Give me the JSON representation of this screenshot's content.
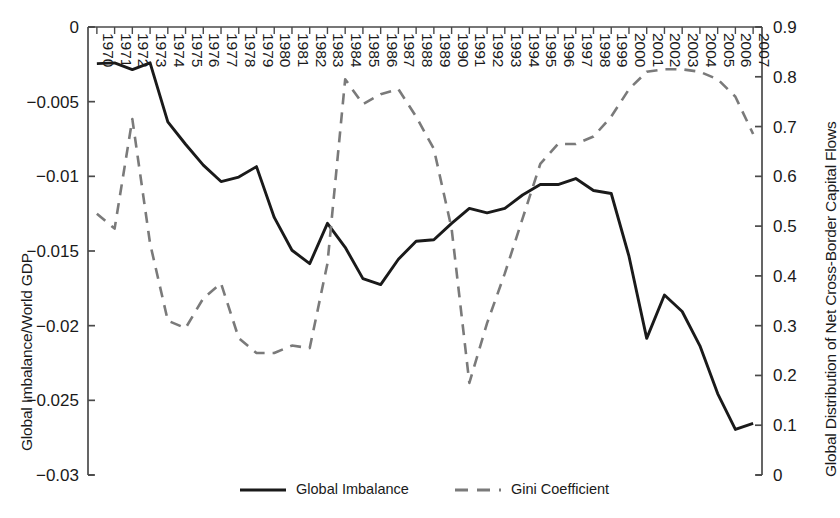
{
  "chart_data": {
    "type": "line",
    "title": "",
    "xlabel": "",
    "ylabel": "Global Imbalance/World GDP",
    "y2label": "Global Distribution of Net Cross-Border Capital Flows",
    "grid": false,
    "legend_position": "bottom-center",
    "x": [
      1970,
      1971,
      1972,
      1973,
      1974,
      1975,
      1976,
      1977,
      1978,
      1979,
      1980,
      1981,
      1982,
      1983,
      1984,
      1985,
      1986,
      1987,
      1988,
      1989,
      1990,
      1991,
      1992,
      1993,
      1994,
      1995,
      1996,
      1997,
      1998,
      1999,
      2000,
      2001,
      2002,
      2003,
      2004,
      2005,
      2006,
      2007
    ],
    "xtick_labels": [
      "1970",
      "1971",
      "1972",
      "1973",
      "1974",
      "1975",
      "1976",
      "1977",
      "1978",
      "1979",
      "1980",
      "1981",
      "1982",
      "1983",
      "1984",
      "1985",
      "1986",
      "1987",
      "1988",
      "1989",
      "1990",
      "1991",
      "1992",
      "1993",
      "1994",
      "1995",
      "1996",
      "1997",
      "1998",
      "1999",
      "2000",
      "2001",
      "2002",
      "2003",
      "2004",
      "2005",
      "2006",
      "2007"
    ],
    "ylim": [
      -0.03,
      0
    ],
    "ytick_labels": [
      "0",
      "−0.005",
      "−0.01",
      "−0.015",
      "−0.02",
      "−0.025",
      "−0.03"
    ],
    "ytick_values": [
      0,
      -0.005,
      -0.01,
      -0.015,
      -0.02,
      -0.025,
      -0.03
    ],
    "y2lim": [
      0,
      0.9
    ],
    "y2tick_labels": [
      "0.9",
      "0.8",
      "0.7",
      "0.6",
      "0.5",
      "0.4",
      "0.3",
      "0.2",
      "0.1",
      "0"
    ],
    "y2tick_values": [
      0.9,
      0.8,
      0.7,
      0.6,
      0.5,
      0.4,
      0.3,
      0.2,
      0.1,
      0
    ],
    "series": [
      {
        "name": "Global Imbalance",
        "axis": "left",
        "style": "solid",
        "color": "#1a1a1a",
        "values": [
          -0.00245,
          -0.0024,
          -0.00285,
          -0.0024,
          -0.00635,
          -0.00785,
          -0.00925,
          -0.01035,
          -0.01005,
          -0.00935,
          -0.01275,
          -0.01495,
          -0.01585,
          -0.01315,
          -0.01475,
          -0.01685,
          -0.01725,
          -0.01555,
          -0.01435,
          -0.01425,
          -0.01315,
          -0.01215,
          -0.01245,
          -0.01215,
          -0.01125,
          -0.01055,
          -0.01055,
          -0.01015,
          -0.01095,
          -0.01115,
          -0.01535,
          -0.02085,
          -0.01795,
          -0.01905,
          -0.02135,
          -0.02455,
          -0.02695,
          -0.02655
        ]
      },
      {
        "name": "Gini Coefficient",
        "axis": "right",
        "style": "dashed",
        "color": "#7a7a7a",
        "values": [
          0.525,
          0.495,
          0.715,
          0.465,
          0.31,
          0.295,
          0.355,
          0.385,
          0.275,
          0.245,
          0.245,
          0.26,
          0.255,
          0.425,
          0.795,
          0.745,
          0.765,
          0.775,
          0.72,
          0.655,
          0.495,
          0.185,
          0.305,
          0.405,
          0.515,
          0.625,
          0.665,
          0.665,
          0.68,
          0.72,
          0.775,
          0.81,
          0.815,
          0.815,
          0.81,
          0.795,
          0.76,
          0.685
        ]
      }
    ]
  },
  "legend": {
    "items": [
      {
        "label": "Global Imbalance",
        "style": "solid",
        "color": "#1a1a1a"
      },
      {
        "label": "Gini Coefficient",
        "style": "dashed",
        "color": "#7a7a7a"
      }
    ]
  }
}
